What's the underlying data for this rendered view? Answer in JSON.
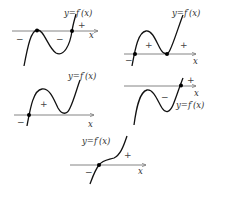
{
  "figure": {
    "graphs": [
      {
        "id": "g1",
        "label": "y=f′(x)",
        "x_label": "x",
        "signs": [
          "−",
          "−",
          "+"
        ]
      },
      {
        "id": "g2",
        "label": "y=f′(x)",
        "x_label": "x",
        "signs": [
          "−",
          "+",
          "+"
        ]
      },
      {
        "id": "g3",
        "label": "y=f′(x)",
        "x_label": "x",
        "signs": [
          "−",
          "+"
        ]
      },
      {
        "id": "g4",
        "label": "y=f′(x)",
        "x_label": "x",
        "signs": [
          "−",
          "+"
        ]
      },
      {
        "id": "g5",
        "label": "y=f′(x)",
        "x_label": "x",
        "signs": [
          "−",
          "+"
        ]
      }
    ]
  }
}
